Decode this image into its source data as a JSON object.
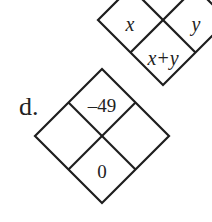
{
  "upper_diamond": {
    "cells": {
      "top": "",
      "left": "x",
      "right": "y",
      "bottom": "x+y"
    }
  },
  "problem_d": {
    "label": "d.",
    "cells": {
      "top": "–49",
      "left": "",
      "right": "",
      "bottom": "0"
    }
  },
  "colors": {
    "line": "#1e1e1e",
    "text": "#222222",
    "background": "#ffffff"
  }
}
